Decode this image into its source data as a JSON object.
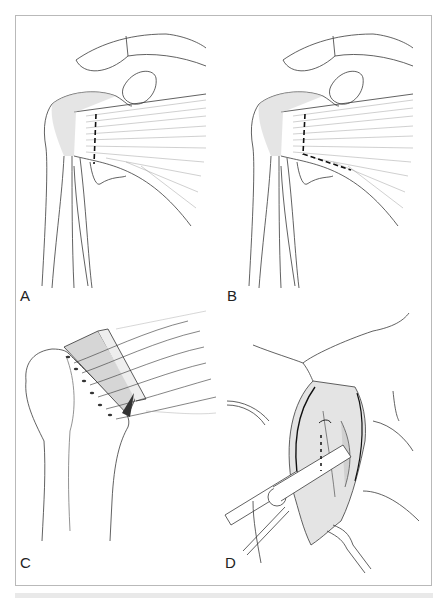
{
  "figure": {
    "colors": {
      "ink": "#2a2a2a",
      "frame": "#b9b9b9",
      "shade": "#d8d8d8",
      "background": "#ffffff"
    },
    "panels": [
      {
        "id": "A",
        "label": "A",
        "content": "Anterior shoulder with straight vertical dashed incision line through subscapularis tendon near lesser tuberosity"
      },
      {
        "id": "B",
        "label": "B",
        "content": "Anterior shoulder with L-shaped dashed incision line through subscapularis tendon"
      },
      {
        "id": "C",
        "label": "C",
        "content": "Proximal humerus with tendon flap held by multiple traction sutures through bone tunnels"
      },
      {
        "id": "D",
        "label": "D",
        "content": "Surgical field view with retractors exposing joint; dashed line marking incision"
      }
    ]
  }
}
